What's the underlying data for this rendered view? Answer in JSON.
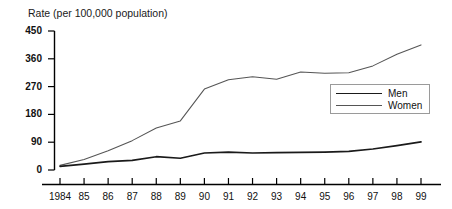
{
  "chart_data": {
    "type": "line",
    "title": "Rate (per 100,000 population)",
    "xlabel": "",
    "ylabel": "Rate (per 100,000 population)",
    "x": [
      "1984",
      "85",
      "86",
      "87",
      "88",
      "89",
      "90",
      "91",
      "92",
      "93",
      "94",
      "95",
      "96",
      "97",
      "98",
      "99"
    ],
    "xlim": [
      1984,
      1999
    ],
    "ylim": [
      0,
      450
    ],
    "yticks": [
      "0",
      "90",
      "180",
      "270",
      "360",
      "450"
    ],
    "ytick_values": [
      0,
      90,
      180,
      270,
      360,
      450
    ],
    "grid": false,
    "legend_position": "right",
    "series": [
      {
        "name": "Men",
        "values": [
          12,
          19,
          27,
          31,
          43,
          38,
          55,
          58,
          55,
          56,
          57,
          58,
          60,
          68,
          79,
          91
        ]
      },
      {
        "name": "Women",
        "values": [
          15,
          34,
          62,
          95,
          136,
          159,
          262,
          292,
          302,
          294,
          317,
          313,
          315,
          337,
          375,
          405
        ]
      }
    ]
  },
  "legend": {
    "items": [
      {
        "label": "Men"
      },
      {
        "label": "Women"
      }
    ]
  },
  "colors": {
    "men_line": "#1a1a1a",
    "women_line": "#555555",
    "axis": "#000000",
    "background": "#ffffff"
  }
}
